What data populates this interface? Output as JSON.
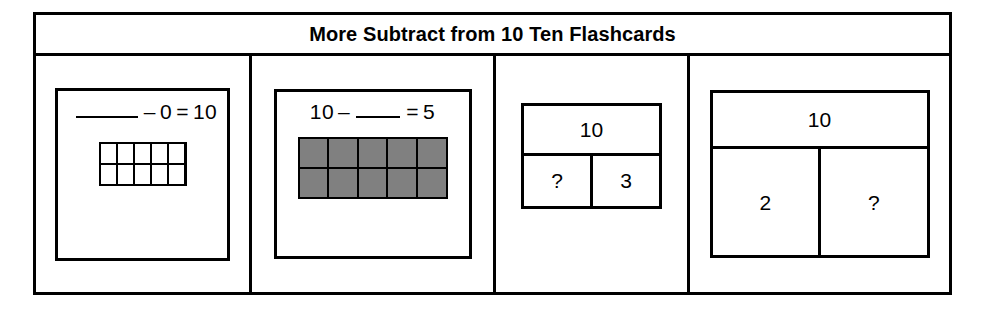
{
  "page": {
    "title": "More Subtract from 10 Ten Flashcards",
    "background_color": "#ffffff",
    "line_color": "#000000",
    "shade_color": "#808080"
  },
  "flashcards": [
    {
      "type": "equation-with-ten-frame",
      "name": "flashcard-blank-minus-0-equals-10",
      "equation": {
        "left_term": "",
        "blank_position": "left",
        "operator": "–",
        "second_term": "0",
        "equals": "=",
        "result": "10",
        "text": "____ – 0 = 10"
      },
      "ten_frame": {
        "rows": 2,
        "columns": 5,
        "total_cells": 10,
        "filled_count": 0,
        "cells": [
          false,
          false,
          false,
          false,
          false,
          false,
          false,
          false,
          false,
          false
        ]
      }
    },
    {
      "type": "equation-with-ten-frame",
      "name": "flashcard-10-minus-blank-equals-5",
      "equation": {
        "left_term": "10",
        "blank_position": "middle",
        "operator": "–",
        "second_term": "",
        "equals": "=",
        "result": "5",
        "text": "10 – ____ = 5"
      },
      "ten_frame": {
        "rows": 2,
        "columns": 5,
        "total_cells": 10,
        "filled_count": 10,
        "cells": [
          true,
          true,
          true,
          true,
          true,
          true,
          true,
          true,
          true,
          true
        ]
      }
    },
    {
      "type": "part-whole-box",
      "name": "flashcard-number-bond-10-unknown-3",
      "bond": {
        "whole": "10",
        "part_left": "?",
        "part_right": "3"
      }
    },
    {
      "type": "part-whole-box",
      "name": "flashcard-number-bond-10-2-unknown",
      "bond": {
        "whole": "10",
        "part_left": "2",
        "part_right": "?"
      }
    }
  ]
}
